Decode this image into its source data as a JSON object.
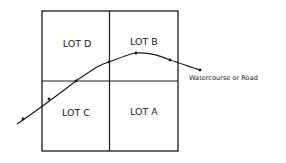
{
  "diagram": {
    "lots": [
      {
        "label": "LOT D",
        "x": 76,
        "y": 44
      },
      {
        "label": "LOT B",
        "x": 144,
        "y": 42
      },
      {
        "label": "LOT C",
        "x": 76,
        "y": 113
      },
      {
        "label": "LOT A",
        "x": 144,
        "y": 112
      }
    ],
    "annotation": "Watercourse or Road",
    "colors": {
      "line": "#1a1a1a",
      "background": "#ffffff"
    }
  }
}
